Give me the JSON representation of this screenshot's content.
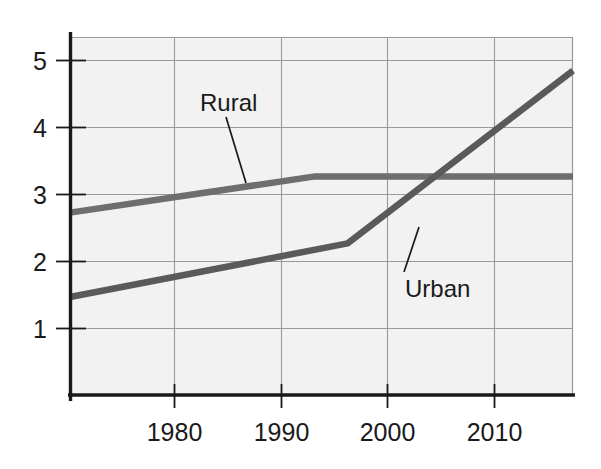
{
  "chart_data": {
    "type": "line",
    "title": "",
    "subtitle": "",
    "xlabel": "",
    "ylabel": "",
    "xlim": [
      1971.0,
      2017.2
    ],
    "ylim": [
      0.0,
      5.35
    ],
    "grid": true,
    "legend_position": "inline-annotations",
    "xticks": [
      1980,
      1990,
      2000,
      2010
    ],
    "xtick_labels": [
      "1980",
      "1990",
      "2000",
      "2010"
    ],
    "yticks": [
      1,
      2,
      3,
      4,
      5
    ],
    "ytick_labels": [
      "1",
      "2",
      "3",
      "4",
      "5"
    ],
    "plot_background": "#f2f2f2",
    "grid_color": "#9a9a9a",
    "axis_color": "#1a1a1a",
    "series": [
      {
        "name": "Rural",
        "color": "#6e6e6e",
        "label": "Rural",
        "x": [
          1971.0,
          1993.5,
          2017.2
        ],
        "values": [
          2.73,
          3.27,
          3.27
        ]
      },
      {
        "name": "Urban",
        "color": "#5a5a5a",
        "label": "Urban",
        "x": [
          1971.0,
          1996.5,
          2017.2
        ],
        "values": [
          1.47,
          2.27,
          4.85
        ]
      }
    ],
    "annotations": [
      {
        "text": "Rural",
        "label_x": 1983.2,
        "label_y": 4.43,
        "leader_from_x": 1985.6,
        "leader_from_y": 4.18,
        "leader_to_x": 1987.5,
        "leader_to_y": 3.19
      },
      {
        "text": "Urban",
        "label_x": 2002.4,
        "label_y": 1.52,
        "leader_from_x": 2002.4,
        "leader_from_y": 1.68,
        "leader_to_x": 2003.8,
        "leader_to_y": 2.36
      }
    ],
    "crossover_year": 2004.6,
    "crossover_value": 3.27
  }
}
